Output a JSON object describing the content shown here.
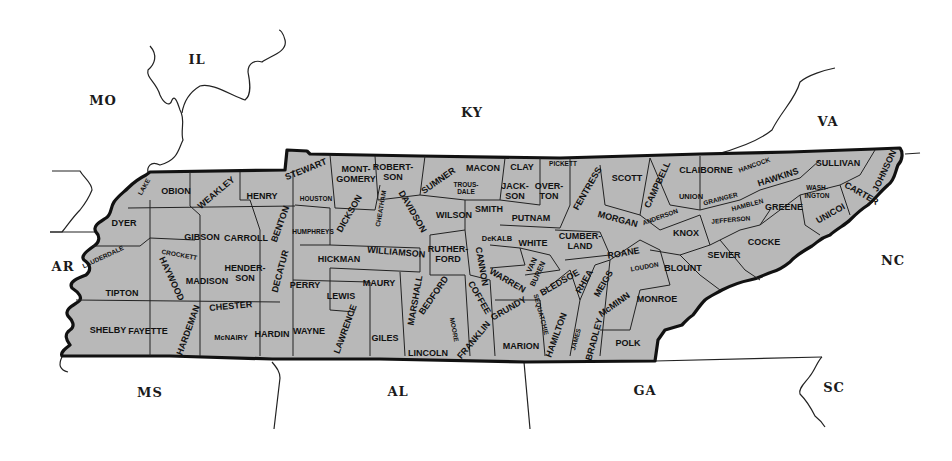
{
  "map": {
    "title": "Tennessee counties",
    "fill_color": "#b8b8b8",
    "outline_color": "#111111",
    "neighbor_states": [
      {
        "abbr": "IL",
        "x": 197,
        "y": 64
      },
      {
        "abbr": "MO",
        "x": 103,
        "y": 105
      },
      {
        "abbr": "KY",
        "x": 472,
        "y": 117
      },
      {
        "abbr": "VA",
        "x": 828,
        "y": 126
      },
      {
        "abbr": "AR",
        "x": 63,
        "y": 271
      },
      {
        "abbr": "NC",
        "x": 893,
        "y": 265
      },
      {
        "abbr": "MS",
        "x": 150,
        "y": 397
      },
      {
        "abbr": "AL",
        "x": 398,
        "y": 396
      },
      {
        "abbr": "GA",
        "x": 645,
        "y": 395
      },
      {
        "abbr": "SC",
        "x": 834,
        "y": 392
      }
    ],
    "counties": [
      {
        "name": "LAKE",
        "x": 146,
        "y": 188,
        "size": "sm",
        "rot": -60
      },
      {
        "name": "OBION",
        "x": 176,
        "y": 194
      },
      {
        "name": "WEAKLEY",
        "x": 218,
        "y": 195,
        "rot": -40
      },
      {
        "name": "HENRY",
        "x": 262,
        "y": 199
      },
      {
        "name": "STEWART",
        "x": 307,
        "y": 172,
        "rot": -22
      },
      {
        "name": "MONT-",
        "x": 356,
        "y": 172
      },
      {
        "name": "GOMERY",
        "x": 356,
        "y": 182
      },
      {
        "name": "ROBERT-",
        "x": 393,
        "y": 170
      },
      {
        "name": "SON",
        "x": 393,
        "y": 180
      },
      {
        "name": "SUMNER",
        "x": 440,
        "y": 183,
        "rot": -35
      },
      {
        "name": "MACON",
        "x": 483,
        "y": 171
      },
      {
        "name": "CLAY",
        "x": 522,
        "y": 170
      },
      {
        "name": "PICKETT",
        "x": 563,
        "y": 166,
        "size": "sm"
      },
      {
        "name": "SCOTT",
        "x": 627,
        "y": 181
      },
      {
        "name": "CLAIBORNE",
        "x": 706,
        "y": 173
      },
      {
        "name": "HANCOCK",
        "x": 755,
        "y": 167,
        "size": "sm",
        "rot": -20
      },
      {
        "name": "SULLIVAN",
        "x": 838,
        "y": 166
      },
      {
        "name": "JOHNSON",
        "x": 887,
        "y": 172,
        "rot": -65
      },
      {
        "name": "HAWKINS",
        "x": 779,
        "y": 180,
        "rot": -18
      },
      {
        "name": "DYER",
        "x": 124,
        "y": 226
      },
      {
        "name": "GIBSON",
        "x": 202,
        "y": 240
      },
      {
        "name": "CARROLL",
        "x": 246,
        "y": 241
      },
      {
        "name": "BENTON",
        "x": 283,
        "y": 225,
        "rot": -70
      },
      {
        "name": "HOUSTON",
        "x": 316,
        "y": 201,
        "size": "sm"
      },
      {
        "name": "HUMPHREYS",
        "x": 313,
        "y": 234,
        "size": "sm"
      },
      {
        "name": "DICKSON",
        "x": 352,
        "y": 215,
        "rot": -60
      },
      {
        "name": "CHEATHAM",
        "x": 383,
        "y": 209,
        "size": "sm",
        "rot": -80
      },
      {
        "name": "DAVIDSON",
        "x": 410,
        "y": 213,
        "rot": 60
      },
      {
        "name": "WILLIAMSON",
        "x": 396,
        "y": 255,
        "rot": 5
      },
      {
        "name": "TROUS-",
        "x": 466,
        "y": 187,
        "size": "sm"
      },
      {
        "name": "DALE",
        "x": 466,
        "y": 194,
        "size": "sm"
      },
      {
        "name": "WILSON",
        "x": 454,
        "y": 218
      },
      {
        "name": "SMITH",
        "x": 489,
        "y": 212
      },
      {
        "name": "JACK-",
        "x": 515,
        "y": 189
      },
      {
        "name": "SON",
        "x": 515,
        "y": 199
      },
      {
        "name": "OVER-",
        "x": 549,
        "y": 189
      },
      {
        "name": "TON",
        "x": 549,
        "y": 199
      },
      {
        "name": "FENTRESS",
        "x": 590,
        "y": 190,
        "rot": -60
      },
      {
        "name": "PUTNAM",
        "x": 531,
        "y": 221
      },
      {
        "name": "DeKALB",
        "x": 497,
        "y": 241,
        "size": "md"
      },
      {
        "name": "WHITE",
        "x": 533,
        "y": 246
      },
      {
        "name": "CUMBER-",
        "x": 580,
        "y": 239
      },
      {
        "name": "LAND",
        "x": 580,
        "y": 249
      },
      {
        "name": "MORGAN",
        "x": 617,
        "y": 222,
        "rot": 15
      },
      {
        "name": "CAMPBELL",
        "x": 660,
        "y": 186,
        "rot": -65
      },
      {
        "name": "ANDERSON",
        "x": 661,
        "y": 219,
        "size": "sm",
        "rot": -20
      },
      {
        "name": "UNION",
        "x": 691,
        "y": 199,
        "size": "md"
      },
      {
        "name": "GRAINGER",
        "x": 721,
        "y": 201,
        "size": "sm",
        "rot": -15
      },
      {
        "name": "HAMBLEN",
        "x": 748,
        "y": 207,
        "size": "sm",
        "rot": -15
      },
      {
        "name": "WASH-",
        "x": 817,
        "y": 190,
        "size": "sm"
      },
      {
        "name": "INGTON",
        "x": 817,
        "y": 198,
        "size": "sm"
      },
      {
        "name": "CARTER",
        "x": 860,
        "y": 196,
        "rot": 30
      },
      {
        "name": "UNICOI",
        "x": 832,
        "y": 216,
        "rot": -30
      },
      {
        "name": "GREENE",
        "x": 784,
        "y": 210
      },
      {
        "name": "JEFFERSON",
        "x": 731,
        "y": 222,
        "size": "sm",
        "rot": -5
      },
      {
        "name": "KNOX",
        "x": 686,
        "y": 236
      },
      {
        "name": "COCKE",
        "x": 764,
        "y": 245
      },
      {
        "name": "SEVIER",
        "x": 724,
        "y": 258
      },
      {
        "name": "LAUDERDALE",
        "x": 104,
        "y": 259,
        "size": "sm",
        "rot": -25
      },
      {
        "name": "CROCKETT",
        "x": 179,
        "y": 257,
        "size": "sm",
        "rot": 10
      },
      {
        "name": "HAYWOOD",
        "x": 169,
        "y": 280,
        "rot": 65
      },
      {
        "name": "TIPTON",
        "x": 122,
        "y": 296
      },
      {
        "name": "MADISON",
        "x": 207,
        "y": 284
      },
      {
        "name": "HENDER-",
        "x": 245,
        "y": 271
      },
      {
        "name": "SON",
        "x": 245,
        "y": 281
      },
      {
        "name": "DECATUR",
        "x": 283,
        "y": 272,
        "rot": -75
      },
      {
        "name": "PERRY",
        "x": 305,
        "y": 288
      },
      {
        "name": "HICKMAN",
        "x": 339,
        "y": 262
      },
      {
        "name": "LEWIS",
        "x": 341,
        "y": 299
      },
      {
        "name": "MAURY",
        "x": 379,
        "y": 286
      },
      {
        "name": "MARSHALL",
        "x": 418,
        "y": 301,
        "rot": -80
      },
      {
        "name": "RUTHER-",
        "x": 448,
        "y": 252
      },
      {
        "name": "FORD",
        "x": 448,
        "y": 262
      },
      {
        "name": "CANNON",
        "x": 479,
        "y": 267,
        "rot": 80
      },
      {
        "name": "WARREN",
        "x": 506,
        "y": 283,
        "rot": 30
      },
      {
        "name": "VAN",
        "x": 534,
        "y": 266,
        "size": "md",
        "rot": -65
      },
      {
        "name": "BUREN",
        "x": 540,
        "y": 275,
        "size": "md",
        "rot": -65
      },
      {
        "name": "BLEDSOE",
        "x": 561,
        "y": 285,
        "rot": -30
      },
      {
        "name": "RHEA",
        "x": 587,
        "y": 283,
        "rot": -60
      },
      {
        "name": "ROANE",
        "x": 624,
        "y": 256,
        "rot": -10
      },
      {
        "name": "MEIGS",
        "x": 606,
        "y": 285,
        "rot": -60
      },
      {
        "name": "LOUDON",
        "x": 645,
        "y": 269,
        "size": "sm",
        "rot": -10
      },
      {
        "name": "BLOUNT",
        "x": 683,
        "y": 271
      },
      {
        "name": "McMINN",
        "x": 616,
        "y": 307,
        "rot": -35
      },
      {
        "name": "MONROE",
        "x": 657,
        "y": 302
      },
      {
        "name": "BEDFORD",
        "x": 436,
        "y": 297,
        "rot": -55
      },
      {
        "name": "COFFEE",
        "x": 477,
        "y": 299,
        "rot": 60
      },
      {
        "name": "GRUNDY",
        "x": 510,
        "y": 311,
        "rot": -30
      },
      {
        "name": "SEQUATCHIE",
        "x": 539,
        "y": 315,
        "size": "sm",
        "rot": 75
      },
      {
        "name": "SHELBY",
        "x": 108,
        "y": 333
      },
      {
        "name": "FAYETTE",
        "x": 148,
        "y": 334
      },
      {
        "name": "HARDEMAN",
        "x": 191,
        "y": 331,
        "rot": -70
      },
      {
        "name": "CHESTER",
        "x": 231,
        "y": 309,
        "rot": -5
      },
      {
        "name": "McNAIRY",
        "x": 231,
        "y": 340,
        "size": "md"
      },
      {
        "name": "HARDIN",
        "x": 272,
        "y": 337
      },
      {
        "name": "WAYNE",
        "x": 309,
        "y": 334
      },
      {
        "name": "LAWRENCE",
        "x": 348,
        "y": 330,
        "rot": -70
      },
      {
        "name": "GILES",
        "x": 385,
        "y": 341
      },
      {
        "name": "MOORE",
        "x": 452,
        "y": 330,
        "size": "sm",
        "rot": 80
      },
      {
        "name": "LINCOLN",
        "x": 428,
        "y": 356
      },
      {
        "name": "FRANKLIN",
        "x": 476,
        "y": 342,
        "rot": -50
      },
      {
        "name": "MARION",
        "x": 521,
        "y": 349
      },
      {
        "name": "HAMILTON",
        "x": 559,
        "y": 336,
        "rot": -70
      },
      {
        "name": "JAMES",
        "x": 578,
        "y": 340,
        "size": "sm",
        "rot": -75
      },
      {
        "name": "BRADLEY",
        "x": 597,
        "y": 340,
        "rot": -75
      },
      {
        "name": "POLK",
        "x": 628,
        "y": 346
      }
    ]
  }
}
